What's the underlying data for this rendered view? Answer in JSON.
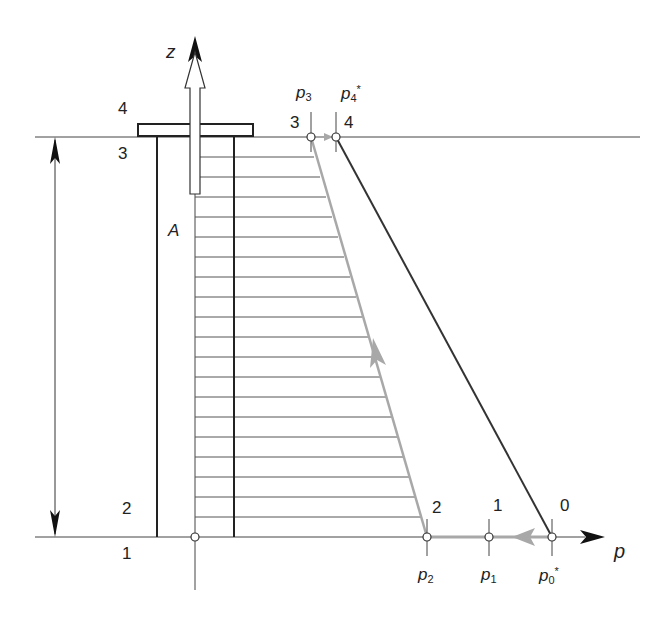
{
  "diagram": {
    "type": "pressure-height process diagram",
    "axes": {
      "vertical_label": "z",
      "horizontal_label": "p"
    },
    "region_label": "A",
    "left_levels": {
      "top_above": "4",
      "top_below": "3",
      "bottom_above": "2",
      "bottom_below": "1"
    },
    "points": [
      {
        "id": "3",
        "state_label": "3",
        "pressure_label": "p",
        "pressure_sub": "3",
        "pressure_sup": ""
      },
      {
        "id": "4",
        "state_label": "4",
        "pressure_label": "p",
        "pressure_sub": "4",
        "pressure_sup": "*"
      },
      {
        "id": "2",
        "state_label": "2",
        "pressure_label": "p",
        "pressure_sub": "2",
        "pressure_sup": ""
      },
      {
        "id": "1",
        "state_label": "1",
        "pressure_label": "p",
        "pressure_sub": "1",
        "pressure_sup": ""
      },
      {
        "id": "0",
        "state_label": "0",
        "pressure_label": "p",
        "pressure_sub": "0",
        "pressure_sup": "*"
      }
    ],
    "colors": {
      "line_dark": "#333333",
      "line_gray": "#a8a8a8",
      "hatch": "#555555",
      "axis_arrow": "#111111"
    },
    "hatch_line_count": 19
  }
}
